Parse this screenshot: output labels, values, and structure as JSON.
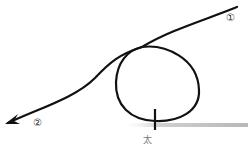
{
  "diagram": {
    "type": "path-with-loop",
    "labels": {
      "start": "①",
      "end": "②",
      "bottom_mark": "太"
    },
    "colors": {
      "stroke": "#111111",
      "ground_line": "#c8c8c8",
      "background": "#ffffff"
    }
  }
}
